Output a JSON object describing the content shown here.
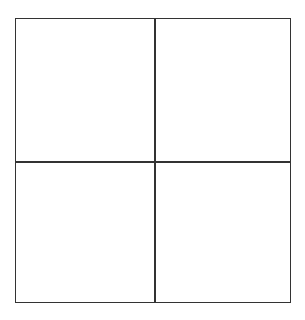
{
  "diagram": {
    "type": "2x2 grid",
    "rows": 2,
    "columns": 2,
    "cells": [
      {
        "row": 0,
        "col": 0,
        "label": ""
      },
      {
        "row": 0,
        "col": 1,
        "label": ""
      },
      {
        "row": 1,
        "col": 0,
        "label": ""
      },
      {
        "row": 1,
        "col": 1,
        "label": ""
      }
    ],
    "line_color": "#333333",
    "background": "#ffffff"
  }
}
